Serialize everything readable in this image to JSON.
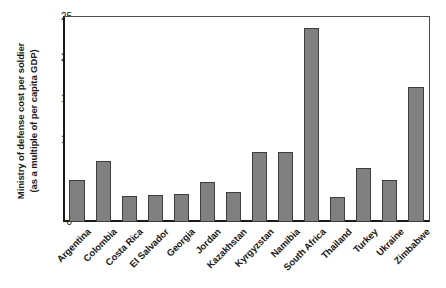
{
  "chart_data": {
    "type": "bar",
    "title": "",
    "xlabel": "",
    "ylabel": "Ministry of defense cost per soldier (as a multiple of per capita GDP)",
    "ylabel_lines": [
      "Ministry of defense cost per soldier",
      "(as a multiple of per capita GDP)"
    ],
    "ylim": [
      0,
      25
    ],
    "yticks": [
      0,
      5,
      10,
      15,
      20,
      25
    ],
    "ytick_labels": [
      "0",
      "5",
      "10",
      "15",
      "20",
      "25"
    ],
    "grid": false,
    "legend": null,
    "bar_color": "#808080",
    "bar_edge_color": "#3d3d3d",
    "axis_color": "#1a1a1a",
    "categories": [
      "Argentina",
      "Colombia",
      "Costa Rica",
      "El Salvador",
      "Georgia",
      "Jordan",
      "Kazakhstan",
      "Kyrgyzstan",
      "Namibia",
      "South Africa",
      "Thailand",
      "Turkey",
      "Ukraine",
      "Zimbabwe"
    ],
    "values": [
      5.1,
      7.4,
      3.2,
      3.3,
      3.4,
      4.9,
      3.7,
      8.5,
      8.5,
      23.7,
      3.1,
      6.6,
      5.1,
      16.5
    ]
  }
}
